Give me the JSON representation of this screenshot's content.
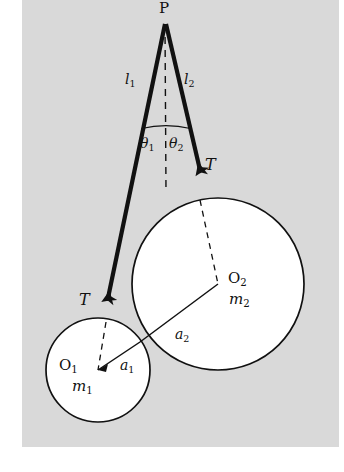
{
  "figure": {
    "background_color": "#d9d9d9",
    "page_color": "#ffffff",
    "ink_color": "#111111",
    "canvas": {
      "width": 344,
      "height": 472
    },
    "plate": {
      "x": 22,
      "y": 0,
      "width": 317,
      "height": 447
    }
  },
  "labels": {
    "apex": "P",
    "string_left_length": "l",
    "string_left_length_sub": "1",
    "string_right_length": "l",
    "string_right_length_sub": "2",
    "angle_left": "θ",
    "angle_left_sub": "1",
    "angle_right": "θ",
    "angle_right_sub": "2",
    "tension_left": "T",
    "tension_right": "T",
    "center_left": "O",
    "center_left_sub": "1",
    "center_right": "O",
    "center_right_sub": "2",
    "mass_left": "m",
    "mass_left_sub": "1",
    "mass_right": "m",
    "mass_right_sub": "2",
    "radius_left": "a",
    "radius_left_sub": "1",
    "radius_right": "a",
    "radius_right_sub": "2"
  },
  "geometry": {
    "apex_point": {
      "x": 165,
      "y": 22
    },
    "vertical_dashed": {
      "x1": 165,
      "y1": 24,
      "x2": 166,
      "y2": 192
    },
    "angle_arc": {
      "cx": 165,
      "cy": 22,
      "r": 108
    },
    "string_left": {
      "x1": 165,
      "y1": 24,
      "x2": 108,
      "y2": 296
    },
    "string_right": {
      "x1": 166,
      "y1": 24,
      "x2": 200,
      "y2": 168
    },
    "circle_left": {
      "cx": 98,
      "cy": 370,
      "r": 52
    },
    "circle_right": {
      "cx": 218,
      "cy": 284,
      "r": 86
    },
    "dash_left_to_center": {
      "x1": 106,
      "y1": 322,
      "x2": 98,
      "y2": 370
    },
    "dash_right_to_center": {
      "x1": 200,
      "y1": 200,
      "x2": 218,
      "y2": 284
    },
    "radius_line_left": {
      "x1": 98,
      "y1": 370,
      "x2": 140,
      "y2": 342
    },
    "radius_line_right": {
      "x1": 218,
      "y1": 284,
      "x2": 140,
      "y2": 342
    }
  },
  "label_positions": {
    "apex": {
      "x": 159,
      "y": 1,
      "size": 15
    },
    "l1": {
      "x": 125,
      "y": 73,
      "size": 14
    },
    "l2": {
      "x": 184,
      "y": 73,
      "size": 14
    },
    "theta1": {
      "x": 141,
      "y": 136,
      "size": 14
    },
    "theta2": {
      "x": 169,
      "y": 136,
      "size": 14
    },
    "T_right": {
      "x": 204,
      "y": 158,
      "size": 15
    },
    "T_left": {
      "x": 78,
      "y": 292,
      "size": 15
    },
    "O2": {
      "x": 228,
      "y": 272,
      "size": 15
    },
    "m2": {
      "x": 228,
      "y": 292,
      "size": 15
    },
    "a2": {
      "x": 174,
      "y": 327,
      "size": 14
    },
    "O1": {
      "x": 60,
      "y": 359,
      "size": 15
    },
    "m1": {
      "x": 72,
      "y": 379,
      "size": 15
    },
    "a1": {
      "x": 120,
      "y": 359,
      "size": 14
    }
  }
}
